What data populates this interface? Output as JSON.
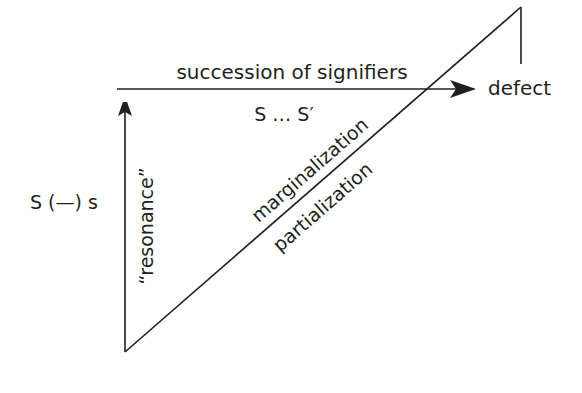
{
  "diagram": {
    "colors": {
      "stroke": "#231f20",
      "background": "#ffffff"
    },
    "labels": {
      "succession": "succession of signifiers",
      "chain": "S … S′",
      "defect": "defect",
      "formula": "S (—) s",
      "resonance": "“resonance”",
      "marginalization": "marginalization",
      "partialization": "partialization"
    },
    "edges": [
      {
        "from": "bottom-vertex",
        "to": "top-arrow-tip",
        "style": "arrow",
        "label": "resonance"
      },
      {
        "from": "top-left",
        "to": "defect",
        "style": "arrow",
        "label": "succession"
      },
      {
        "from": "bottom-vertex",
        "to": "top-right-vertex",
        "style": "line",
        "labels": [
          "marginalization",
          "partialization"
        ]
      },
      {
        "from": "top-right-vertex",
        "to": "defect-drop",
        "style": "line"
      }
    ]
  }
}
